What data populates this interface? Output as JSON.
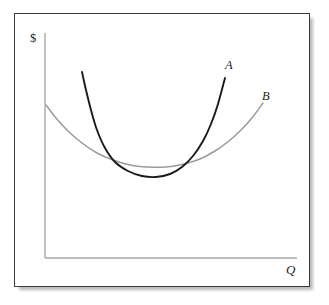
{
  "figure": {
    "kind": "cost-curve-diagram",
    "background_color": "#ffffff",
    "frame_border_color": "#3a3a3c"
  },
  "axes": {
    "y_label": "$",
    "x_label": "Q",
    "axis_color": "#a8a8a8",
    "origin_px": {
      "x": 45,
      "y": 258
    },
    "y_top_px": 33,
    "x_right_px": 297
  },
  "chart_data": {
    "type": "line",
    "title": "",
    "xlabel": "Q",
    "ylabel": "$",
    "grid": false,
    "legend": "inline-end-labels",
    "xlim": [
      0,
      100
    ],
    "ylim": [
      0,
      100
    ],
    "series": [
      {
        "name": "A",
        "label": "A",
        "color": "#1a1a1a",
        "width": 1.9,
        "description": "steep narrow U-shaped average cost curve, low minimum, rises sharply on both sides",
        "points_px": [
          [
            82,
            72
          ],
          [
            86,
            90
          ],
          [
            91,
            110
          ],
          [
            97,
            130
          ],
          [
            105,
            148
          ],
          [
            115,
            162
          ],
          [
            128,
            171
          ],
          [
            142,
            176
          ],
          [
            156,
            177
          ],
          [
            170,
            174
          ],
          [
            182,
            167
          ],
          [
            193,
            156
          ],
          [
            203,
            141
          ],
          [
            211,
            124
          ],
          [
            218,
            104
          ],
          [
            225,
            78
          ]
        ]
      },
      {
        "name": "B",
        "label": "B",
        "color": "#9a9a9a",
        "width": 1.5,
        "description": "broad shallow U-shaped average cost curve, wider and flatter minimum",
        "points_px": [
          [
            46,
            105
          ],
          [
            56,
            118
          ],
          [
            68,
            131
          ],
          [
            82,
            143
          ],
          [
            97,
            153
          ],
          [
            113,
            160
          ],
          [
            130,
            165
          ],
          [
            148,
            167
          ],
          [
            166,
            167
          ],
          [
            184,
            164
          ],
          [
            200,
            159
          ],
          [
            215,
            151
          ],
          [
            229,
            141
          ],
          [
            241,
            130
          ],
          [
            252,
            118
          ],
          [
            263,
            103
          ]
        ]
      }
    ]
  },
  "labels": {
    "dollar": "$",
    "quantity": "Q",
    "curve_a": "A",
    "curve_b": "B"
  }
}
